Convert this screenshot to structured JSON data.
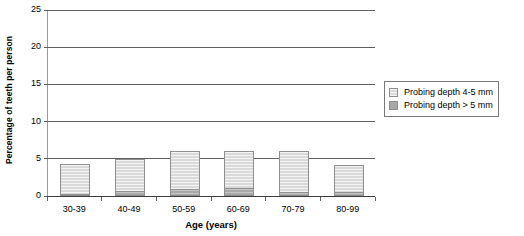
{
  "chart_data": {
    "type": "bar",
    "stacked": true,
    "title": "",
    "subtitle": "",
    "xlabel": "Age (years)",
    "ylabel": "Percentage of teeth per person",
    "categories": [
      "30-39",
      "40-49",
      "50-59",
      "60-69",
      "70-79",
      "80-99"
    ],
    "series": [
      {
        "name": "Probing depth 4-5 mm",
        "color": "#d9d9d9",
        "values": [
          4.0,
          4.3,
          5.0,
          4.9,
          5.4,
          3.7
        ]
      },
      {
        "name": "Probing depth > 5 mm",
        "color": "#a8a8a8",
        "values": [
          0.3,
          0.7,
          1.0,
          1.1,
          0.6,
          0.5
        ]
      }
    ],
    "totals": [
      4.3,
      5.0,
      6.0,
      6.0,
      6.0,
      4.2
    ],
    "ylim": [
      0,
      25
    ],
    "yticks": [
      0,
      5,
      10,
      15,
      20,
      25
    ],
    "ytick_labels": [
      "0",
      "5",
      "10",
      "15",
      "20",
      "25"
    ],
    "grid": true,
    "grid_axis": "y",
    "legend_position": "right"
  },
  "legend": {
    "items": [
      {
        "label": "Probing depth 4-5 mm",
        "swatch": "light-gray-swatch"
      },
      {
        "label": "Probing depth > 5 mm",
        "swatch": "dark-gray-swatch"
      }
    ]
  }
}
